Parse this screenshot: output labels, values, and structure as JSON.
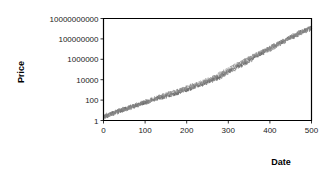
{
  "chart_data": {
    "type": "line",
    "title": "",
    "xlabel": "Date",
    "ylabel": "Price",
    "yscale": "log",
    "xlim": [
      0,
      500
    ],
    "ylim": [
      1,
      10000000000
    ],
    "grid": false,
    "legend": false,
    "xticks": [
      "0",
      "100",
      "200",
      "300",
      "400",
      "500"
    ],
    "xtick_values": [
      0,
      100,
      200,
      300,
      400,
      500
    ],
    "yticks": [
      "1",
      "100",
      "10000",
      "1000000",
      "100000000",
      "10000000000"
    ],
    "ytick_values": [
      1,
      100,
      10000,
      1000000,
      100000000,
      10000000000
    ],
    "series": [
      {
        "name": "path-1",
        "color": "#4d4d4d",
        "x": [
          0,
          10,
          20,
          30,
          40,
          50,
          60,
          70,
          80,
          90,
          100,
          110,
          120,
          130,
          140,
          150,
          160,
          170,
          180,
          190,
          200,
          210,
          220,
          230,
          240,
          250,
          260,
          270,
          280,
          290,
          300,
          310,
          320,
          330,
          340,
          350,
          360,
          370,
          380,
          390,
          400,
          410,
          420,
          430,
          440,
          450,
          460,
          470,
          480,
          490,
          500
        ],
        "values": [
          2.2,
          3.4,
          5.1,
          7.6,
          9.2,
          14.5,
          19.0,
          26.0,
          33.0,
          47.0,
          61.0,
          88.0,
          110.0,
          150.0,
          205.0,
          260.0,
          330.0,
          470.0,
          600.0,
          880.0,
          1150.0,
          1600.0,
          2300.0,
          3100.0,
          4400.0,
          6200.0,
          9500.0,
          14000.0,
          22000.0,
          36000.0,
          62000.0,
          110000.0,
          180000.0,
          300000.0,
          520000.0,
          900000.0,
          1500000.0,
          2500000.0,
          4200000.0,
          7000000.0,
          12000000.0,
          20000000.0,
          33000000.0,
          55000000.0,
          90000000.0,
          150000000.0,
          250000000.0,
          400000000.0,
          620000000.0,
          900000000.0,
          1400000000.0
        ]
      },
      {
        "name": "path-2",
        "color": "#666666",
        "x": [
          0,
          10,
          20,
          30,
          40,
          50,
          60,
          70,
          80,
          90,
          100,
          110,
          120,
          130,
          140,
          150,
          160,
          170,
          180,
          190,
          200,
          210,
          220,
          230,
          240,
          250,
          260,
          270,
          280,
          290,
          300,
          310,
          320,
          330,
          340,
          350,
          360,
          370,
          380,
          390,
          400,
          410,
          420,
          430,
          440,
          450,
          460,
          470,
          480,
          490,
          500
        ],
        "values": [
          2.6,
          3.0,
          4.4,
          6.2,
          8.8,
          11.5,
          17.0,
          23.0,
          31.0,
          40.0,
          55.0,
          72.0,
          100.0,
          135.0,
          175.0,
          240.0,
          300.0,
          400.0,
          540.0,
          700.0,
          950.0,
          1400.0,
          1900.0,
          2700.0,
          3600.0,
          5200.0,
          7800.0,
          11000.0,
          17000.0,
          28000.0,
          48000.0,
          85000.0,
          140000.0,
          240000.0,
          400000.0,
          700000.0,
          1200000.0,
          2000000.0,
          3300000.0,
          5500000.0,
          9000000.0,
          15000000.0,
          26000000.0,
          43000000.0,
          70000000.0,
          115000000.0,
          190000000.0,
          300000000.0,
          470000000.0,
          700000000.0,
          1000000000.0
        ]
      },
      {
        "name": "path-3",
        "color": "#7a7a7a",
        "x": [
          0,
          10,
          20,
          30,
          40,
          50,
          60,
          70,
          80,
          90,
          100,
          110,
          120,
          130,
          140,
          150,
          160,
          170,
          180,
          190,
          200,
          210,
          220,
          230,
          240,
          250,
          260,
          270,
          280,
          290,
          300,
          310,
          320,
          330,
          340,
          350,
          360,
          370,
          380,
          390,
          400,
          410,
          420,
          430,
          440,
          450,
          460,
          470,
          480,
          490,
          500
        ],
        "values": [
          2.0,
          2.8,
          4.0,
          5.5,
          8.0,
          12.0,
          16.0,
          21.0,
          29.0,
          43.0,
          58.0,
          80.0,
          120.0,
          165.0,
          230.0,
          310.0,
          420.0,
          580.0,
          820.0,
          1100.0,
          1500.0,
          2100.0,
          2900.0,
          4000.0,
          5800.0,
          8500.0,
          13000.0,
          19000.0,
          30000.0,
          50000.0,
          85000.0,
          150000.0,
          250000.0,
          420000.0,
          700000.0,
          1150000.0,
          1900000.0,
          3100000.0,
          5000000.0,
          8200000.0,
          13500000.0,
          22000000.0,
          36000000.0,
          58000000.0,
          95000000.0,
          155000000.0,
          250000000.0,
          380000000.0,
          560000000.0,
          820000000.0,
          1200000000.0
        ]
      },
      {
        "name": "path-4",
        "color": "#8c8c8c",
        "x": [
          0,
          10,
          20,
          30,
          40,
          50,
          60,
          70,
          80,
          90,
          100,
          110,
          120,
          130,
          140,
          150,
          160,
          170,
          180,
          190,
          200,
          210,
          220,
          230,
          240,
          250,
          260,
          270,
          280,
          290,
          300,
          310,
          320,
          330,
          340,
          350,
          360,
          370,
          380,
          390,
          400,
          410,
          420,
          430,
          440,
          450,
          460,
          470,
          480,
          490,
          500
        ],
        "values": [
          2.4,
          3.6,
          4.6,
          7.0,
          10.5,
          13.0,
          18.5,
          25.0,
          36.0,
          50.0,
          68.0,
          95.0,
          130.0,
          190.0,
          250.0,
          345.0,
          480.0,
          650.0,
          900.0,
          1250.0,
          1750.0,
          2400.0,
          3400.0,
          4800.0,
          7000.0,
          10500.0,
          16000.0,
          24000.0,
          38000.0,
          60000.0,
          100000.0,
          170000.0,
          290000.0,
          480000.0,
          800000.0,
          1300000.0,
          2100000.0,
          3400000.0,
          5400000.0,
          8600000.0,
          14000000.0,
          23000000.0,
          37000000.0,
          60000000.0,
          98000000.0,
          160000000.0,
          260000000.0,
          390000000.0,
          580000000.0,
          850000000.0,
          1250000000.0
        ]
      }
    ]
  },
  "figure": {
    "background": "#ffffff",
    "axis_color": "#000000"
  }
}
